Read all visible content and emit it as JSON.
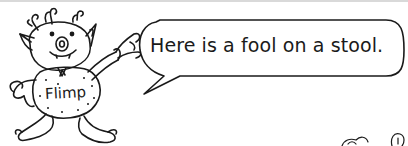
{
  "character": {
    "name_label": "Flimp",
    "icon": "flimp-creature-illustration"
  },
  "speech_bubble": {
    "text": "Here is a fool on a stool."
  },
  "colors": {
    "ink": "#1a1a1a",
    "background": "#ffffff",
    "rule": "#d9d9d9"
  }
}
